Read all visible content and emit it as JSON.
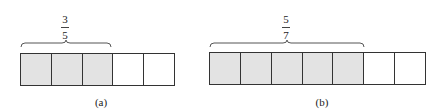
{
  "panels": [
    {
      "id": "a",
      "caption": "(a)",
      "numerator": "3",
      "denominator": "5",
      "total_cells": 5,
      "shaded_cells": 3
    },
    {
      "id": "b",
      "caption": "(b)",
      "numerator": "5",
      "denominator": "7",
      "total_cells": 7,
      "shaded_cells": 5
    }
  ],
  "colors": {
    "shaded": "#e3e3e3",
    "unshaded": "#ffffff",
    "border": "#333333"
  }
}
